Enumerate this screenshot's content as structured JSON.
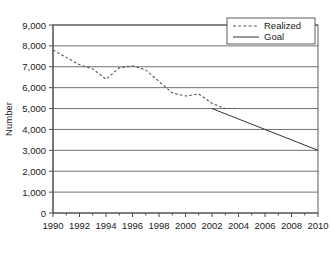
{
  "chart_data": {
    "type": "line",
    "title": "",
    "xlabel": "",
    "ylabel": "Number",
    "xlim": [
      1990,
      2010
    ],
    "ylim": [
      0,
      9000
    ],
    "ytick_step": 1000,
    "xtick_step": 2,
    "minor_xtick_step": 1,
    "grid": "horizontal",
    "legend_position": "top-right",
    "yticks": [
      "0",
      "1,000",
      "2,000",
      "3,000",
      "4,000",
      "5,000",
      "6,000",
      "7,000",
      "8,000",
      "9,000"
    ],
    "ytick_values": [
      0,
      1000,
      2000,
      3000,
      4000,
      5000,
      6000,
      7000,
      8000,
      9000
    ],
    "xticks": [
      "1990",
      "1992",
      "1994",
      "1996",
      "1998",
      "2000",
      "2002",
      "2004",
      "2006",
      "2008",
      "2010"
    ],
    "xtick_values": [
      1990,
      1992,
      1994,
      1996,
      1998,
      2000,
      2002,
      2004,
      2006,
      2008,
      2010
    ],
    "series": [
      {
        "name": "Realized",
        "style": "dashed",
        "color": "#555555",
        "x": [
          1990,
          1991,
          1992,
          1993,
          1994,
          1995,
          1996,
          1997,
          1998,
          1999,
          2000,
          2001,
          2002,
          2003,
          2004
        ],
        "values": [
          7800,
          7450,
          7100,
          6900,
          6400,
          6950,
          7050,
          6850,
          6300,
          5750,
          5600,
          5700,
          5250,
          5000,
          5000
        ]
      },
      {
        "name": "Goal",
        "style": "solid",
        "color": "#333333",
        "x": [
          2002,
          2010
        ],
        "values": [
          5000,
          3000
        ]
      }
    ]
  },
  "legend": {
    "entries": [
      {
        "label": "Realized",
        "style": "dashed"
      },
      {
        "label": "Goal",
        "style": "solid"
      }
    ]
  },
  "axes": {
    "y_title": "Number"
  }
}
